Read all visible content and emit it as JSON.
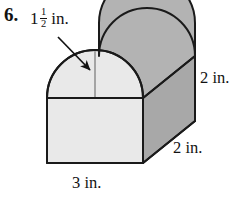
{
  "problem": {
    "number": "6."
  },
  "figure": {
    "type": "solid-geometry-diagram",
    "shape": "semicircular-arch-prism",
    "colors": {
      "outline": "#1a1a1a",
      "front_face_fill": "#e8e8e8",
      "top_back_fill": "#b3b3b3",
      "side_face_fill": "#a8a8a8",
      "radius_line": "#8a8a8a",
      "background": "#ffffff"
    }
  },
  "labels": {
    "radius": {
      "whole": "1",
      "numerator": "1",
      "denominator": "2",
      "unit": "in.",
      "full_text": "1 1/2 in.",
      "refers_to": "semicircle radius"
    },
    "height": {
      "value": "2",
      "unit": "in.",
      "full_text": "2 in.",
      "refers_to": "rectangle height"
    },
    "depth": {
      "value": "2",
      "unit": "in.",
      "full_text": "2 in.",
      "refers_to": "prism depth"
    },
    "width": {
      "value": "3",
      "unit": "in.",
      "full_text": "3 in.",
      "refers_to": "rectangle width / semicircle diameter"
    }
  },
  "annotations": {
    "leader_arrow": {
      "from": "radius-label",
      "to": "semicircle-arc",
      "style": "solid line with filled arrowhead"
    },
    "radius_segment": {
      "style": "thin vertical line",
      "from": "semicircle-center",
      "to": "semicircle-apex"
    }
  }
}
